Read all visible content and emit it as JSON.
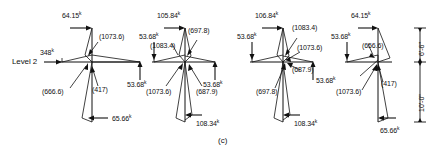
{
  "figure": {
    "caption": "(c)",
    "level_label": "Level 2",
    "units_note_suffix": "k"
  },
  "dimensions": {
    "upper": "6'-6\"",
    "lower": "10'-0\""
  },
  "panels": [
    {
      "id": "panel-1",
      "forces": [
        {
          "name": "top-force",
          "value": "64.15",
          "unit": "k"
        },
        {
          "name": "left-force",
          "value": "348",
          "unit": "k"
        },
        {
          "name": "right-force",
          "value": "53.68",
          "unit": "k"
        },
        {
          "name": "bottom-force",
          "value": "65.66",
          "unit": "k"
        }
      ],
      "moments": [
        {
          "name": "moment-upper",
          "value": "(1073.6)"
        },
        {
          "name": "moment-left",
          "value": "(666.6)"
        },
        {
          "name": "moment-center",
          "value": "(417)"
        }
      ]
    },
    {
      "id": "panel-2",
      "forces": [
        {
          "name": "top-force",
          "value": "105.84",
          "unit": "k"
        },
        {
          "name": "left-force",
          "value": "53.68",
          "unit": "k"
        },
        {
          "name": "right-force",
          "value": "53.68",
          "unit": "k"
        },
        {
          "name": "bottom-force",
          "value": "108.34",
          "unit": "k"
        }
      ],
      "moments": [
        {
          "name": "moment-upper-right",
          "value": "(697.8)"
        },
        {
          "name": "moment-upper-left",
          "value": "(1083.4)"
        },
        {
          "name": "moment-lower-left",
          "value": "(1073.6)"
        },
        {
          "name": "moment-lower-right",
          "value": "(687.9)"
        }
      ]
    },
    {
      "id": "panel-3",
      "forces": [
        {
          "name": "top-force",
          "value": "106.84",
          "unit": "k"
        },
        {
          "name": "left-force",
          "value": "53.68",
          "unit": "k"
        },
        {
          "name": "right-force",
          "value": "53.68",
          "unit": "k"
        },
        {
          "name": "bottom-force",
          "value": "108.34",
          "unit": "k"
        }
      ],
      "moments": [
        {
          "name": "moment-upper-right",
          "value": "(1083.4)"
        },
        {
          "name": "moment-mid-right",
          "value": "(1073.6)"
        },
        {
          "name": "moment-lower-right",
          "value": "(687.9)"
        },
        {
          "name": "moment-lower-center",
          "value": "(697.8)"
        }
      ]
    },
    {
      "id": "panel-4",
      "forces": [
        {
          "name": "top-force",
          "value": "64.15",
          "unit": "k"
        },
        {
          "name": "left-force",
          "value": "53.68",
          "unit": "k"
        },
        {
          "name": "bottom-force",
          "value": "65.66",
          "unit": "k"
        }
      ],
      "moments": [
        {
          "name": "moment-upper",
          "value": "(656.6)"
        },
        {
          "name": "moment-center",
          "value": "(417)"
        },
        {
          "name": "moment-lower-left",
          "value": "(1073.6)"
        }
      ]
    }
  ]
}
